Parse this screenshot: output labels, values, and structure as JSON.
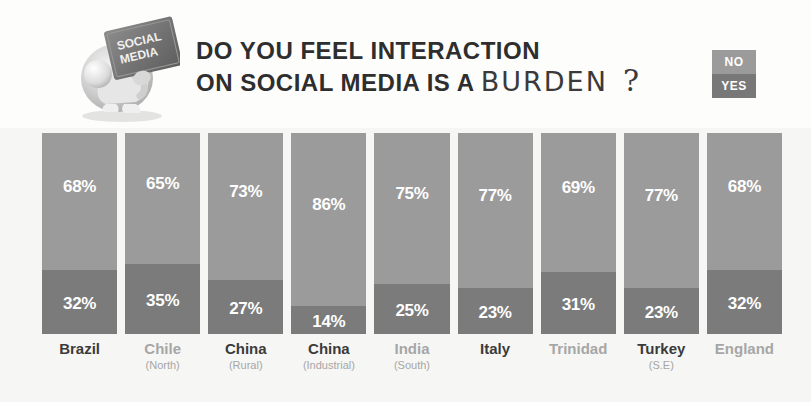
{
  "header": {
    "title_line1": "DO YOU FEEL INTERACTION",
    "title_line2_prefix": "ON SOCIAL MEDIA IS A",
    "title_line2_emphasis": "BURDEN",
    "title_line2_qmark": "?",
    "mascot_label_line1": "SOCIAL",
    "mascot_label_line2": "MEDIA",
    "mascot_icon": "person-carrying-social-media-burden-icon"
  },
  "legend": {
    "no_label": "NO",
    "yes_label": "YES",
    "no_color": "#9b9b9b",
    "yes_color": "#7b7b7b"
  },
  "chart_data": {
    "type": "bar",
    "title": "DO YOU FEEL INTERACTION ON SOCIAL MEDIA IS A BURDEN ?",
    "xlabel": "",
    "ylabel": "",
    "ylim": [
      0,
      100
    ],
    "grid": false,
    "legend_position": "top-right",
    "stacked": true,
    "unit": "%",
    "categories": [
      "Brazil",
      "Chile",
      "China",
      "China",
      "India",
      "Italy",
      "Trinidad",
      "Turkey",
      "England"
    ],
    "category_sublabels": [
      "",
      "(North)",
      "(Rural)",
      "(Industrial)",
      "(South)",
      "",
      "",
      "(S.E)",
      ""
    ],
    "series": [
      {
        "name": "NO",
        "values": [
          68,
          65,
          73,
          86,
          75,
          77,
          69,
          77,
          68
        ]
      },
      {
        "name": "YES",
        "values": [
          32,
          35,
          27,
          14,
          25,
          23,
          31,
          23,
          32
        ]
      }
    ],
    "value_labels": {
      "no": [
        "68%",
        "65%",
        "73%",
        "86%",
        "75%",
        "77%",
        "69%",
        "77%",
        "68%"
      ],
      "yes": [
        "32%",
        "35%",
        "27%",
        "14%",
        "25%",
        "23%",
        "31%",
        "23%",
        "32%"
      ]
    },
    "label_styles": [
      "dark",
      "muted",
      "dark",
      "dark",
      "muted",
      "dark",
      "muted",
      "dark",
      "muted"
    ]
  }
}
